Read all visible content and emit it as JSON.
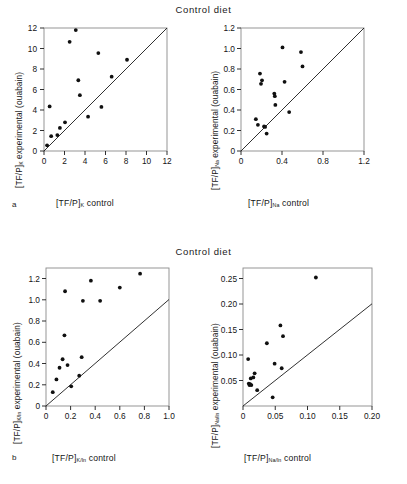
{
  "figure": {
    "panel_a_letter": "a",
    "panel_b_letter": "b",
    "title_top": "Control  diet",
    "title_bottom": "Control  diet"
  },
  "chart_data": [
    {
      "id": "panel-a-left",
      "type": "scatter",
      "title": "Control diet",
      "panel_letter": "a",
      "xlabel": "[TF/P]K control",
      "ylabel": "[TF/P]K experimental (ouabain)",
      "xlabel_base": "[TF/P]",
      "xlabel_sub": "K",
      "xlabel_suffix": " control",
      "ylabel_base": "[TF/P]",
      "ylabel_sub": "K",
      "ylabel_suffix": " experimental (ouabain)",
      "xlim": [
        0,
        12
      ],
      "ylim": [
        0,
        12
      ],
      "xticks": [
        0,
        2,
        4,
        6,
        8,
        10,
        12
      ],
      "yticks": [
        0,
        2,
        4,
        6,
        8,
        10,
        12
      ],
      "xticklabels": [
        "0",
        "2",
        "4",
        "6",
        "8",
        "10",
        "12"
      ],
      "yticklabels": [
        "0",
        "2",
        "4",
        "6",
        "8",
        "10",
        "12"
      ],
      "grid": false,
      "identity_line": true,
      "points": [
        {
          "x": 0.3,
          "y": 0.55
        },
        {
          "x": 0.55,
          "y": 4.35
        },
        {
          "x": 0.7,
          "y": 1.45
        },
        {
          "x": 1.3,
          "y": 1.55
        },
        {
          "x": 1.55,
          "y": 2.25
        },
        {
          "x": 2.05,
          "y": 2.8
        },
        {
          "x": 2.5,
          "y": 10.65
        },
        {
          "x": 3.1,
          "y": 11.8
        },
        {
          "x": 3.35,
          "y": 6.9
        },
        {
          "x": 3.5,
          "y": 5.45
        },
        {
          "x": 4.3,
          "y": 3.35
        },
        {
          "x": 5.3,
          "y": 9.55
        },
        {
          "x": 5.6,
          "y": 4.3
        },
        {
          "x": 6.6,
          "y": 7.25
        },
        {
          "x": 8.1,
          "y": 8.9
        }
      ]
    },
    {
      "id": "panel-a-right",
      "type": "scatter",
      "title": "Control diet",
      "panel_letter": "a",
      "xlabel": "[TF/P]Na control",
      "ylabel": "[TF/P]Na experimental (ouabain)",
      "xlabel_base": "[TF/P]",
      "xlabel_sub": "Na",
      "xlabel_suffix": " control",
      "ylabel_base": "[TF/P]",
      "ylabel_sub": "Na",
      "ylabel_suffix": " experimental (ouabain)",
      "xlim": [
        0,
        1.2
      ],
      "ylim": [
        0,
        1.2
      ],
      "xticks": [
        0,
        0.4,
        0.8,
        1.2
      ],
      "yticks": [
        0,
        0.2,
        0.4,
        0.6,
        0.8,
        1.0,
        1.2
      ],
      "xticklabels": [
        "0",
        "0.4",
        "0.8",
        "1.2"
      ],
      "yticklabels": [
        "0",
        "0.2",
        "0.4",
        "0.6",
        "0.8",
        "1.0",
        "1.2"
      ],
      "grid": false,
      "identity_line": true,
      "points": [
        {
          "x": 0.145,
          "y": 0.31
        },
        {
          "x": 0.165,
          "y": 0.255
        },
        {
          "x": 0.185,
          "y": 0.755
        },
        {
          "x": 0.195,
          "y": 0.655
        },
        {
          "x": 0.205,
          "y": 0.69
        },
        {
          "x": 0.225,
          "y": 0.24
        },
        {
          "x": 0.235,
          "y": 0.235
        },
        {
          "x": 0.25,
          "y": 0.17
        },
        {
          "x": 0.325,
          "y": 0.56
        },
        {
          "x": 0.33,
          "y": 0.535
        },
        {
          "x": 0.335,
          "y": 0.45
        },
        {
          "x": 0.405,
          "y": 1.01
        },
        {
          "x": 0.425,
          "y": 0.675
        },
        {
          "x": 0.47,
          "y": 0.38
        },
        {
          "x": 0.585,
          "y": 0.965
        },
        {
          "x": 0.6,
          "y": 0.825
        }
      ]
    },
    {
      "id": "panel-b-left",
      "type": "scatter",
      "title": "Control diet",
      "panel_letter": "b",
      "xlabel": "[TF/P]K/In control",
      "ylabel": "[TF/P]K/In experimental (ouabain)",
      "xlabel_base": "[TF/P]",
      "xlabel_sub": "K/In",
      "xlabel_suffix": " control",
      "ylabel_base": "[TF/P]",
      "ylabel_sub": "K/In",
      "ylabel_suffix": " experimental (ouabain)",
      "xlim": [
        0,
        1.0
      ],
      "ylim": [
        0,
        1.3
      ],
      "xticks": [
        0,
        0.2,
        0.4,
        0.6,
        0.8,
        1.0
      ],
      "yticks": [
        0,
        0.2,
        0.4,
        0.6,
        0.8,
        1.0,
        1.2
      ],
      "xticklabels": [
        "0",
        "0.2",
        "0.4",
        "0.6",
        "0.8",
        "1.0"
      ],
      "yticklabels": [
        "0",
        "0.2",
        "0.4",
        "0.6",
        "0.8",
        "1.0",
        "1.2"
      ],
      "grid": false,
      "identity_line": true,
      "points": [
        {
          "x": 0.055,
          "y": 0.13
        },
        {
          "x": 0.085,
          "y": 0.25
        },
        {
          "x": 0.11,
          "y": 0.36
        },
        {
          "x": 0.135,
          "y": 0.44
        },
        {
          "x": 0.15,
          "y": 0.665
        },
        {
          "x": 0.155,
          "y": 1.08
        },
        {
          "x": 0.175,
          "y": 0.385
        },
        {
          "x": 0.205,
          "y": 0.185
        },
        {
          "x": 0.27,
          "y": 0.285
        },
        {
          "x": 0.29,
          "y": 0.46
        },
        {
          "x": 0.3,
          "y": 0.99
        },
        {
          "x": 0.365,
          "y": 1.18
        },
        {
          "x": 0.44,
          "y": 0.99
        },
        {
          "x": 0.6,
          "y": 1.115
        },
        {
          "x": 0.765,
          "y": 1.245
        }
      ]
    },
    {
      "id": "panel-b-right",
      "type": "scatter",
      "title": "Control diet",
      "panel_letter": "b",
      "xlabel": "[TF/P]Na/In control",
      "ylabel": "[TF/P]Na/In experimental (ouabain)",
      "xlabel_base": "[TF/P]",
      "xlabel_sub": "Na/In",
      "xlabel_suffix": " control",
      "ylabel_base": "[TF/P]",
      "ylabel_sub": "Na/In",
      "ylabel_suffix": " experimental (ouabain)",
      "xlim": [
        0,
        0.2
      ],
      "ylim": [
        0,
        0.27
      ],
      "xticks": [
        0,
        0.05,
        0.1,
        0.15,
        0.2
      ],
      "yticks": [
        0.05,
        0.1,
        0.15,
        0.2,
        0.25
      ],
      "xticklabels": [
        "0",
        "0.05",
        "0.10",
        "0.15",
        "0.20"
      ],
      "yticklabels": [
        "0.05",
        "0.10",
        "0.15",
        "0.20",
        "0.25"
      ],
      "grid": false,
      "identity_line": true,
      "points": [
        {
          "x": 0.008,
          "y": 0.092
        },
        {
          "x": 0.009,
          "y": 0.044
        },
        {
          "x": 0.01,
          "y": 0.041
        },
        {
          "x": 0.011,
          "y": 0.043
        },
        {
          "x": 0.012,
          "y": 0.054
        },
        {
          "x": 0.013,
          "y": 0.041
        },
        {
          "x": 0.016,
          "y": 0.056
        },
        {
          "x": 0.018,
          "y": 0.064
        },
        {
          "x": 0.022,
          "y": 0.031
        },
        {
          "x": 0.037,
          "y": 0.123
        },
        {
          "x": 0.046,
          "y": 0.017
        },
        {
          "x": 0.049,
          "y": 0.083
        },
        {
          "x": 0.058,
          "y": 0.158
        },
        {
          "x": 0.06,
          "y": 0.074
        },
        {
          "x": 0.062,
          "y": 0.137
        },
        {
          "x": 0.113,
          "y": 0.252
        }
      ]
    }
  ]
}
